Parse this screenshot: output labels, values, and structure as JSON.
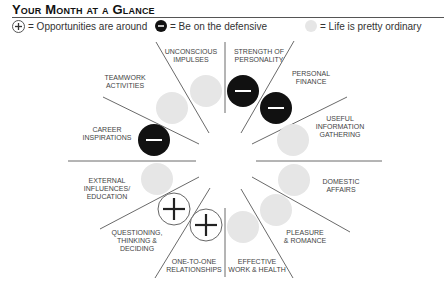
{
  "header": {
    "title": "Your Month at a Glance"
  },
  "legend": [
    {
      "icon": "plus-circle-icon",
      "label": "= Opportunities are around"
    },
    {
      "icon": "minus-circle-icon",
      "label": "= Be on the defensive"
    },
    {
      "icon": "grey-circle-icon",
      "label": "= Life is pretty ordinary"
    }
  ],
  "colors": {
    "defensive": "#111111",
    "ordinary": "#e6e6e6",
    "line": "#666666"
  },
  "sectors": [
    {
      "label1": "Strength of",
      "label2": "Personality",
      "status": "defensive"
    },
    {
      "label1": "Personal",
      "label2": "Finance",
      "status": "defensive"
    },
    {
      "label1": "Useful",
      "label2": "Information",
      "label3": "Gathering",
      "status": "ordinary"
    },
    {
      "label1": "Domestic",
      "label2": "Affairs",
      "status": "ordinary"
    },
    {
      "label1": "Pleasure",
      "label2": "& Romance",
      "status": "ordinary"
    },
    {
      "label1": "Effective",
      "label2": "Work & Health",
      "status": "ordinary"
    },
    {
      "label1": "One-to-One",
      "label2": "Relationships",
      "status": "opportunity"
    },
    {
      "label1": "Questioning,",
      "label2": "Thinking &",
      "label3": "Deciding",
      "status": "opportunity"
    },
    {
      "label1": "External",
      "label2": "Influences/",
      "label3": "Education",
      "status": "ordinary"
    },
    {
      "label1": "Career",
      "label2": "Inspirations",
      "status": "defensive"
    },
    {
      "label1": "Teamwork",
      "label2": "Activities",
      "status": "ordinary"
    },
    {
      "label1": "Unconscious",
      "label2": "Impulses",
      "status": "ordinary"
    }
  ]
}
